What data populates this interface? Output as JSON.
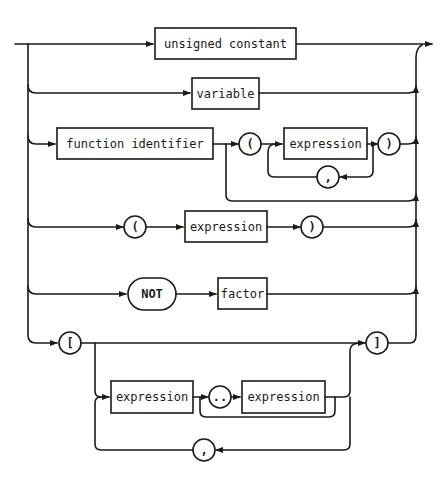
{
  "diagram": {
    "type": "syntax-diagram",
    "subject": "factor",
    "rows": [
      {
        "id": "unsigned-constant",
        "elements": [
          {
            "kind": "nonterminal",
            "label": "unsigned constant"
          }
        ]
      },
      {
        "id": "variable",
        "elements": [
          {
            "kind": "nonterminal",
            "label": "variable"
          }
        ]
      },
      {
        "id": "function-call",
        "elements": [
          {
            "kind": "nonterminal",
            "label": "function identifier"
          },
          {
            "kind": "terminal",
            "label": "("
          },
          {
            "kind": "nonterminal",
            "label": "expression"
          },
          {
            "kind": "terminal",
            "label": ")"
          },
          {
            "kind": "loop-separator",
            "label": ","
          }
        ]
      },
      {
        "id": "parenthesized",
        "elements": [
          {
            "kind": "terminal",
            "label": "("
          },
          {
            "kind": "nonterminal",
            "label": "expression"
          },
          {
            "kind": "terminal",
            "label": ")"
          }
        ]
      },
      {
        "id": "not",
        "elements": [
          {
            "kind": "keyword",
            "label": "NOT"
          },
          {
            "kind": "nonterminal",
            "label": "factor"
          }
        ]
      },
      {
        "id": "set",
        "elements": [
          {
            "kind": "terminal",
            "label": "["
          },
          {
            "kind": "nonterminal",
            "label": "expression"
          },
          {
            "kind": "terminal",
            "label": ".."
          },
          {
            "kind": "nonterminal",
            "label": "expression"
          },
          {
            "kind": "loop-separator",
            "label": ","
          },
          {
            "kind": "terminal",
            "label": "]"
          }
        ]
      }
    ]
  },
  "labels": {
    "unsigned_constant": "unsigned constant",
    "variable": "variable",
    "function_identifier": "function identifier",
    "open_paren": "(",
    "close_paren": ")",
    "expression": "expression",
    "comma": ",",
    "not": "NOT",
    "factor": "factor",
    "open_bracket": "[",
    "close_bracket": "]",
    "range": ".."
  }
}
